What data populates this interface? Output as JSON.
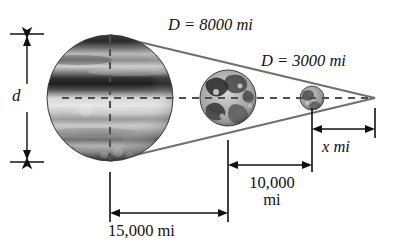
{
  "figure": {
    "name": "similar-triangles-planet-diagram",
    "type": "geometry-diagram",
    "background_color": "#ffffff",
    "ink_color": "#111111",
    "cone_line_color": "#6f6f6f",
    "dimension_line_color": "#1a1a1a",
    "dashed_line_color": "#555555"
  },
  "labels": {
    "diameter_d": "d",
    "distance_big": "D = 8000 mi",
    "distance_small": "D = 3000 mi",
    "baseline_15000": "15,000 mi",
    "mid_10000_line1": "10,000",
    "mid_10000_line2": "mi",
    "unknown_x": "x mi"
  },
  "measurements": [
    {
      "name": "d",
      "label": "d",
      "value": null,
      "unit": "mi",
      "orientation": "vertical",
      "description": "unknown diameter of large planet"
    },
    {
      "name": "D-large",
      "label": "D = 8000 mi",
      "value": 8000,
      "unit": "mi",
      "description": "diameter of middle planet"
    },
    {
      "name": "D-small",
      "label": "D = 3000 mi",
      "value": 3000,
      "unit": "mi",
      "description": "diameter of small planet"
    },
    {
      "name": "baseline",
      "label": "15,000 mi",
      "value": 15000,
      "unit": "mi",
      "orientation": "horizontal",
      "description": "distance from large planet to middle planet"
    },
    {
      "name": "middle-span",
      "label": "10,000 mi",
      "value": 10000,
      "unit": "mi",
      "orientation": "horizontal",
      "description": "distance from middle planet to small planet"
    },
    {
      "name": "unknown-span",
      "label": "x mi",
      "value": null,
      "unit": "mi",
      "orientation": "horizontal",
      "description": "distance from small planet to apex"
    }
  ],
  "bodies": [
    {
      "name": "large-planet",
      "style": "banded-gas-giant",
      "cx": 110,
      "cy": 98,
      "r": 63
    },
    {
      "name": "middle-planet",
      "style": "mottled-terrestrial",
      "cx": 228,
      "cy": 98,
      "r": 28
    },
    {
      "name": "small-planet",
      "style": "small-terrestrial",
      "cx": 312,
      "cy": 98,
      "r": 12
    }
  ],
  "cone": {
    "apex_x": 375,
    "apex_y": 98,
    "base_x": 110,
    "base_top_y": 35,
    "base_bottom_y": 161
  }
}
